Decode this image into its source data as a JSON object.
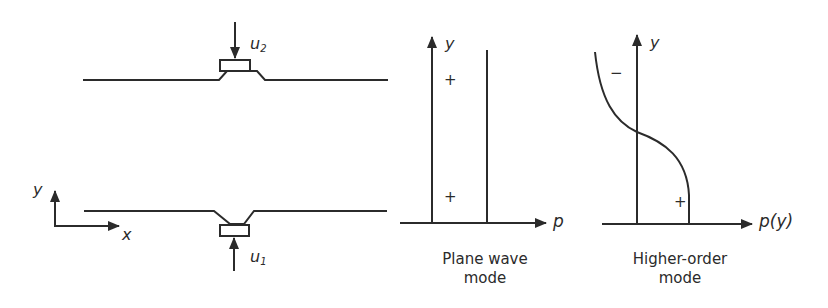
{
  "figure": {
    "left_panel": {
      "description": "Duct with two opposing transducers",
      "top_transducer_label": "u",
      "top_transducer_subscript": "2",
      "bottom_transducer_label": "u",
      "bottom_transducer_subscript": "1",
      "axis_y_label": "y",
      "axis_x_label": "x"
    },
    "middle_panel": {
      "y_axis_label": "y",
      "x_axis_label": "p",
      "sign_top": "+",
      "sign_bottom": "+",
      "caption_line1": "Plane wave",
      "caption_line2": "mode"
    },
    "right_panel": {
      "y_axis_label": "y",
      "x_axis_label": "p(y)",
      "sign_top": "−",
      "sign_bottom": "+",
      "caption_line1": "Higher-order",
      "caption_line2": "mode"
    }
  },
  "colors": {
    "stroke": "#2b2b2b",
    "background": "#ffffff"
  }
}
